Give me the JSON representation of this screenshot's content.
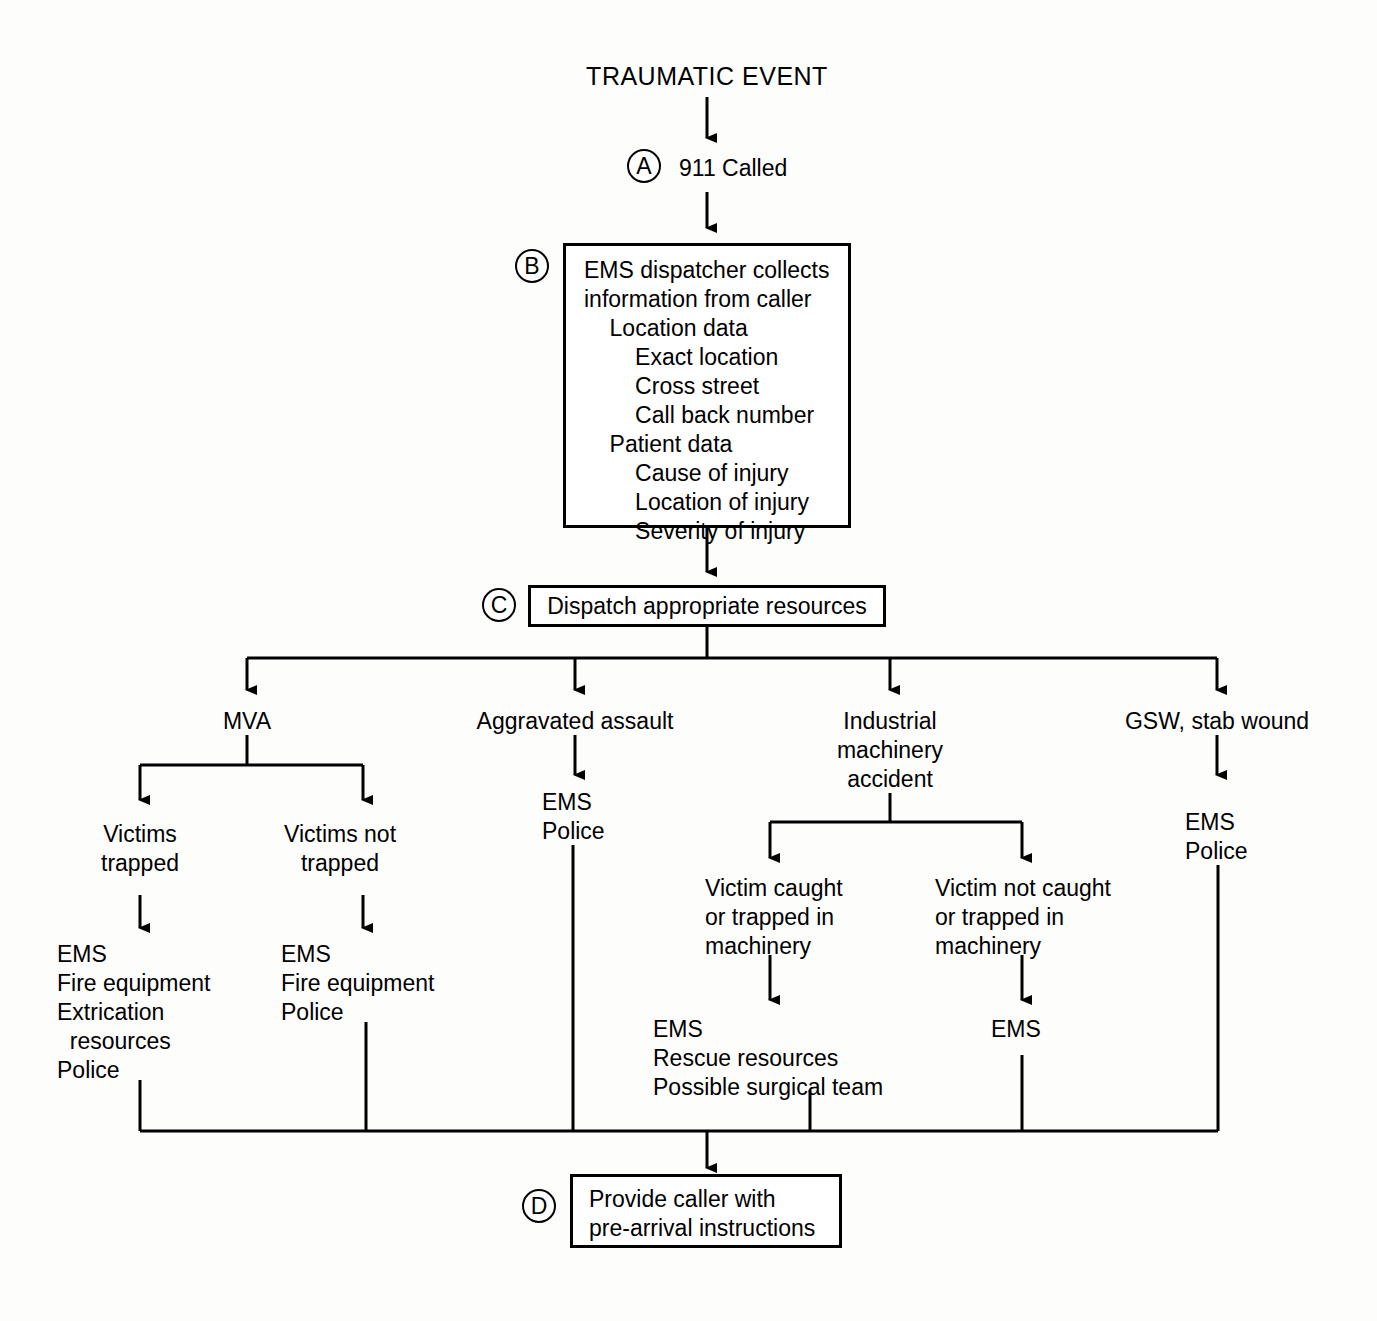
{
  "diagram": {
    "title": "TRAUMATIC EVENT",
    "steps": {
      "a": {
        "marker": "A",
        "label": "911 Called"
      },
      "b": {
        "marker": "B",
        "lines": [
          "EMS dispatcher collects",
          "information from caller",
          "    Location data",
          "        Exact location",
          "        Cross street",
          "        Call back number",
          "    Patient data",
          "        Cause of injury",
          "        Location of injury",
          "        Severity of injury"
        ]
      },
      "c": {
        "marker": "C",
        "label": "Dispatch appropriate resources"
      },
      "d": {
        "marker": "D",
        "lines": [
          "Provide caller with",
          "pre-arrival instructions"
        ]
      }
    },
    "branches": {
      "mva": {
        "label": "MVA",
        "children": {
          "trapped": {
            "label": "Victims\ntrapped",
            "resources": "EMS\nFire equipment\nExtrication\n  resources\nPolice"
          },
          "not_trapped": {
            "label": "Victims not\ntrapped",
            "resources": "EMS\nFire equipment\nPolice"
          }
        }
      },
      "assault": {
        "label": "Aggravated assault",
        "resources": "EMS\nPolice"
      },
      "industrial": {
        "label": "Industrial\nmachinery\naccident",
        "children": {
          "caught": {
            "label": "Victim caught\nor trapped in\nmachinery",
            "resources": "EMS\nRescue resources\nPossible surgical team"
          },
          "not_caught": {
            "label": "Victim not caught\nor trapped in\nmachinery",
            "resources": "EMS"
          }
        }
      },
      "gsw": {
        "label": "GSW, stab wound",
        "resources": "EMS\nPolice"
      }
    },
    "colors": {
      "line": "#000000",
      "background": "#ffffff",
      "text": "#000000"
    }
  }
}
